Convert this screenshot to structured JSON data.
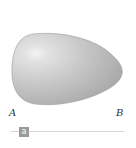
{
  "figure": {
    "shape": "egg",
    "fill_light": "#f2f2f2",
    "fill_dark": "#a6a6a6",
    "outline": "#9a9a9a"
  },
  "labels": {
    "left": "A",
    "right": "B"
  },
  "slider": {
    "handle_label": "a",
    "track_color": "#d8d8d8",
    "handle_color": "#9a9a9a"
  }
}
